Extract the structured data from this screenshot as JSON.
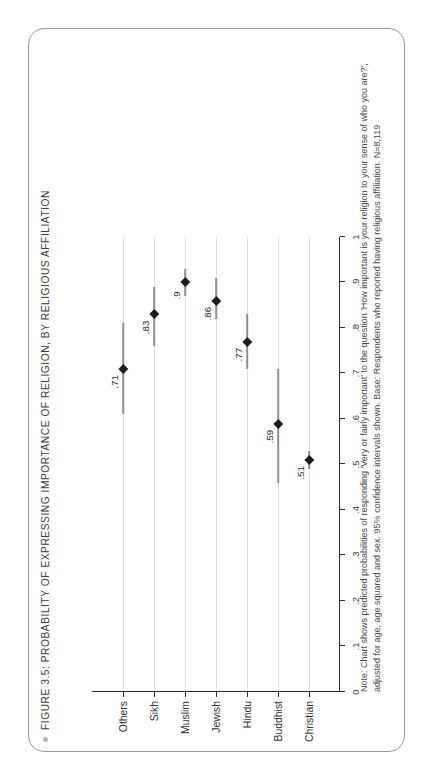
{
  "figure": {
    "title": "FIGURE 3.5: PROBABILITY OF EXPRESSING IMPORTANCE OF RELIGION, BY RELIGIOUS AFFILIATION",
    "bullet_icon": "bullet-dot-icon",
    "note": "Note: Chart shows predicted probabilities of responding 'Very or fairly important' to the question 'How important is your religion to your sense of who you are?', adjusted for age, age squared and sex. 95% confidence intervals shown. Base: Respondents who reported having religious affiliation. N=8,119",
    "frame_color": "#9a9a9a",
    "marker_color": "#1d1d1d",
    "ci_color": "#8e8e8e",
    "grid_color": "#dcdcdc",
    "axis_color": "#2b2b2b"
  },
  "chart_data": {
    "type": "scatter",
    "title": "FIGURE 3.5: PROBABILITY OF EXPRESSING IMPORTANCE OF RELIGION, BY RELIGIOUS AFFILIATION",
    "xlabel": "",
    "ylabel": "",
    "orientation": "horizontal-value-axis",
    "grid": true,
    "legend": "none",
    "value_axis": {
      "min": 0,
      "max": 1,
      "ticks": [
        0,
        0.1,
        0.2,
        0.3,
        0.4,
        0.5,
        0.6,
        0.7,
        0.8,
        0.9,
        1
      ],
      "tick_labels": [
        "0",
        ".1",
        ".2",
        ".3",
        ".4",
        ".5",
        ".6",
        ".7",
        ".8",
        ".9",
        "1"
      ]
    },
    "categories": [
      "Christian",
      "Buddhist",
      "Hindu",
      "Jewish",
      "Muslim",
      "Sikh",
      "Others"
    ],
    "values": [
      0.51,
      0.59,
      0.77,
      0.86,
      0.9,
      0.83,
      0.71
    ],
    "value_labels": [
      ".51",
      ".59",
      ".77",
      ".86",
      ".9",
      ".83",
      ".71"
    ],
    "ci_low": [
      0.49,
      0.46,
      0.71,
      0.82,
      0.87,
      0.76,
      0.61
    ],
    "ci_high": [
      0.53,
      0.71,
      0.83,
      0.91,
      0.93,
      0.89,
      0.81
    ]
  }
}
